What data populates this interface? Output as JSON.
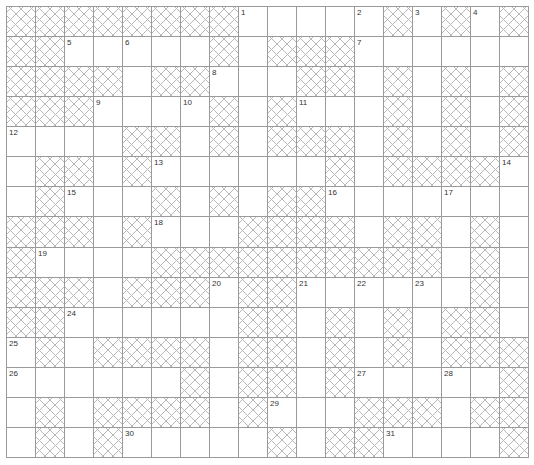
{
  "puzzle": {
    "type": "crossword",
    "columns": 18,
    "rows": 15,
    "colors": {
      "grid_line": "#9a9a9a",
      "hatch": "#b8b8b8",
      "cell_bg": "#ffffff",
      "number": "#333333"
    },
    "legend": "# = blocked (hatched) cell, . = open cell, number = clue-numbered open cell",
    "layout": [
      [
        "#",
        "#",
        "#",
        "#",
        "#",
        "#",
        "#",
        "#",
        "1",
        ".",
        ".",
        ".",
        "2",
        "#",
        "3",
        "#",
        "4",
        "#"
      ],
      [
        "#",
        "#",
        "5",
        ".",
        "6",
        ".",
        ".",
        "#",
        ".",
        "#",
        "#",
        "#",
        "7",
        ".",
        ".",
        ".",
        ".",
        "."
      ],
      [
        "#",
        "#",
        "#",
        "#",
        ".",
        "#",
        "#",
        "8",
        ".",
        ".",
        "#",
        "#",
        ".",
        "#",
        ".",
        "#",
        ".",
        "#"
      ],
      [
        "#",
        "#",
        "#",
        "9",
        ".",
        ".",
        "10",
        "#",
        ".",
        "#",
        "11",
        ".",
        ".",
        "#",
        ".",
        "#",
        ".",
        "#"
      ],
      [
        "12",
        ".",
        ".",
        ".",
        "#",
        "#",
        ".",
        "#",
        ".",
        "#",
        "#",
        "#",
        ".",
        "#",
        ".",
        "#",
        ".",
        "#"
      ],
      [
        ".",
        "#",
        "#",
        ".",
        "#",
        "13",
        ".",
        ".",
        ".",
        ".",
        ".",
        "#",
        ".",
        "#",
        "#",
        "#",
        "#",
        "14"
      ],
      [
        ".",
        "#",
        "15",
        ".",
        ".",
        "#",
        ".",
        "#",
        ".",
        "#",
        "#",
        "16",
        ".",
        ".",
        ".",
        "17",
        ".",
        "."
      ],
      [
        "#",
        "#",
        "#",
        ".",
        "#",
        "18",
        ".",
        ".",
        "#",
        "#",
        "#",
        "#",
        ".",
        "#",
        "#",
        ".",
        "#",
        "."
      ],
      [
        "#",
        "19",
        ".",
        ".",
        ".",
        "#",
        "#",
        "#",
        "#",
        "#",
        "#",
        "#",
        "#",
        "#",
        "#",
        ".",
        "#",
        "."
      ],
      [
        "#",
        "#",
        "#",
        ".",
        "#",
        "#",
        "#",
        "20",
        "#",
        "#",
        "21",
        ".",
        "22",
        ".",
        "23",
        ".",
        "#",
        "."
      ],
      [
        "#",
        "#",
        "24",
        ".",
        ".",
        ".",
        ".",
        ".",
        "#",
        "#",
        ".",
        "#",
        ".",
        "#",
        ".",
        "#",
        "#",
        "."
      ],
      [
        "25",
        "#",
        ".",
        "#",
        "#",
        "#",
        "#",
        ".",
        "#",
        "#",
        ".",
        "#",
        ".",
        "#",
        ".",
        "#",
        "#",
        "#"
      ],
      [
        "26",
        ".",
        ".",
        ".",
        ".",
        ".",
        "#",
        ".",
        "#",
        "#",
        ".",
        "#",
        "27",
        ".",
        ".",
        "28",
        ".",
        "#"
      ],
      [
        ".",
        "#",
        ".",
        "#",
        "#",
        "#",
        "#",
        ".",
        "#",
        "29",
        ".",
        ".",
        "#",
        "#",
        "#",
        ".",
        "#",
        "#"
      ],
      [
        ".",
        "#",
        ".",
        "#",
        "30",
        ".",
        ".",
        ".",
        ".",
        "#",
        ".",
        "#",
        "#",
        "31",
        ".",
        ".",
        ".",
        "#"
      ]
    ],
    "clue_numbers": [
      "1",
      "2",
      "3",
      "4",
      "5",
      "6",
      "7",
      "8",
      "9",
      "10",
      "11",
      "12",
      "13",
      "14",
      "15",
      "16",
      "17",
      "18",
      "19",
      "20",
      "21",
      "22",
      "23",
      "24",
      "25",
      "26",
      "27",
      "28",
      "29",
      "30",
      "31"
    ],
    "entries": {}
  }
}
